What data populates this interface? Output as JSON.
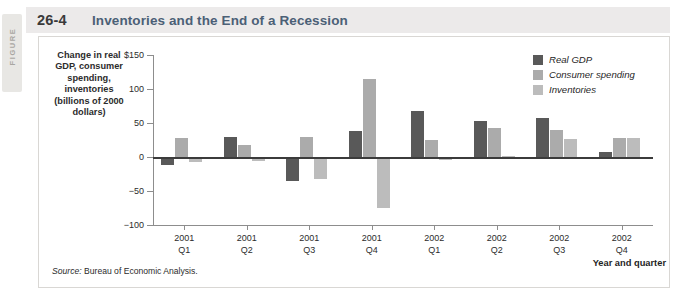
{
  "figure": {
    "side_label": "FIGURE",
    "number": "26-4",
    "title": "Inventories and the End of a Recession",
    "source": "Source: Bureau of Economic Analysis."
  },
  "chart_data": {
    "type": "bar",
    "title": "Inventories and the End of a Recession",
    "ylabel": "Change in real GDP, consumer spending, inventories (billions of 2000 dollars)",
    "xlabel": "Year and quarter",
    "ylim": [
      -100,
      150
    ],
    "yticks": [
      {
        "value": 150,
        "label": "$150"
      },
      {
        "value": 100,
        "label": "100"
      },
      {
        "value": 50,
        "label": "50"
      },
      {
        "value": 0,
        "label": "0"
      },
      {
        "value": -50,
        "label": "−50"
      },
      {
        "value": -100,
        "label": "−100"
      }
    ],
    "grid": false,
    "legend_position": "top-right",
    "categories": [
      {
        "year": "2001",
        "quarter": "Q1"
      },
      {
        "year": "2001",
        "quarter": "Q2"
      },
      {
        "year": "2001",
        "quarter": "Q3"
      },
      {
        "year": "2001",
        "quarter": "Q4"
      },
      {
        "year": "2002",
        "quarter": "Q1"
      },
      {
        "year": "2002",
        "quarter": "Q2"
      },
      {
        "year": "2002",
        "quarter": "Q3"
      },
      {
        "year": "2002",
        "quarter": "Q4"
      }
    ],
    "series": [
      {
        "name": "Real GDP",
        "color": "#595959",
        "values": [
          -12,
          30,
          -35,
          38,
          67,
          53,
          57,
          7
        ]
      },
      {
        "name": "Consumer spending",
        "color": "#ababab",
        "values": [
          28,
          17,
          29,
          115,
          25,
          42,
          39,
          28
        ]
      },
      {
        "name": "Inventories",
        "color": "#bcbcbc",
        "values": [
          -8,
          -6,
          -32,
          -75,
          -5,
          2,
          27,
          28
        ]
      }
    ]
  }
}
